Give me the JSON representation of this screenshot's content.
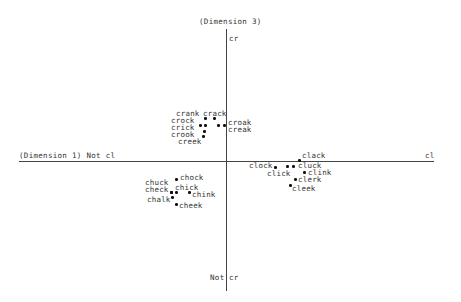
{
  "chart_data": {
    "type": "scatter",
    "title": "",
    "xlabel": "(Dimension 1) Not cl",
    "x_positive_label": "cl",
    "ylabel": "(Dimension 3)",
    "y_positive_label": "cr",
    "y_negative_label": "Not cr",
    "grid": false,
    "legend": null,
    "points": [
      {
        "label": "crank",
        "x": -21,
        "y": 43,
        "px": 205,
        "py": 118,
        "lx": 176,
        "ly": 110
      },
      {
        "label": "crack",
        "x": -12,
        "y": 43,
        "px": 214,
        "py": 118,
        "lx": 203,
        "ly": 110
      },
      {
        "label": "crock",
        "x": -26,
        "y": 35,
        "px": 200,
        "py": 125,
        "lx": 171,
        "ly": 117
      },
      {
        "label": "crick",
        "x": -21,
        "y": 35,
        "px": 205,
        "py": 125,
        "lx": 171,
        "ly": 124
      },
      {
        "label": "croak",
        "x": -8,
        "y": 36,
        "px": 218,
        "py": 125,
        "lx": 228,
        "ly": 119
      },
      {
        "label": "creak",
        "x": -1,
        "y": 36,
        "px": 224,
        "py": 125,
        "lx": 228,
        "ly": 126
      },
      {
        "label": "crook",
        "x": -22,
        "y": 30,
        "px": 204,
        "py": 131,
        "lx": 171,
        "ly": 131
      },
      {
        "label": "creek",
        "x": -23,
        "y": 24,
        "px": 203,
        "py": 136,
        "lx": 178,
        "ly": 138
      },
      {
        "label": "clack",
        "x": 74,
        "y": 0,
        "px": 299,
        "py": 160,
        "lx": 302,
        "ly": 152
      },
      {
        "label": "clock",
        "x": 49,
        "y": -6,
        "px": 275,
        "py": 167,
        "lx": 249,
        "ly": 162
      },
      {
        "label": "click",
        "x": 61,
        "y": -6,
        "px": 287,
        "py": 166,
        "lx": 267,
        "ly": 170
      },
      {
        "label": "cluck",
        "x": 67,
        "y": -6,
        "px": 293,
        "py": 166,
        "lx": 298,
        "ly": 162
      },
      {
        "label": "clink",
        "x": 78,
        "y": -12,
        "px": 304,
        "py": 172,
        "lx": 308,
        "ly": 169
      },
      {
        "label": "clerk",
        "x": 69,
        "y": -18,
        "px": 295,
        "py": 179,
        "lx": 298,
        "ly": 176
      },
      {
        "label": "cleek",
        "x": 64,
        "y": -24,
        "px": 290,
        "py": 185,
        "lx": 292,
        "ly": 185
      },
      {
        "label": "chock",
        "x": -50,
        "y": -18,
        "px": 176,
        "py": 179,
        "lx": 180,
        "ly": 174
      },
      {
        "label": "chuck",
        "x": -56,
        "y": -31,
        "px": 171,
        "py": 192,
        "lx": 145,
        "ly": 179
      },
      {
        "label": "check",
        "x": -56,
        "y": -31,
        "px": 171,
        "py": 192,
        "lx": 145,
        "ly": 186
      },
      {
        "label": "chick",
        "x": -50,
        "y": -31,
        "px": 176,
        "py": 192,
        "lx": 175,
        "ly": 184
      },
      {
        "label": "chink",
        "x": -37,
        "y": -31,
        "px": 189,
        "py": 192,
        "lx": 192,
        "ly": 191
      },
      {
        "label": "chalk",
        "x": -54,
        "y": -37,
        "px": 172,
        "py": 197,
        "lx": 147,
        "ly": 196
      },
      {
        "label": "cheek",
        "x": -50,
        "y": -43,
        "px": 176,
        "py": 204,
        "lx": 179,
        "ly": 202
      }
    ]
  },
  "axes": {
    "dim1_left": "(Dimension 1) Not cl",
    "dim1_right": "cl",
    "dim3_top_title": "(Dimension 3)",
    "dim3_top": "cr",
    "dim3_bottom_not": "Not",
    "dim3_bottom": "cr"
  }
}
